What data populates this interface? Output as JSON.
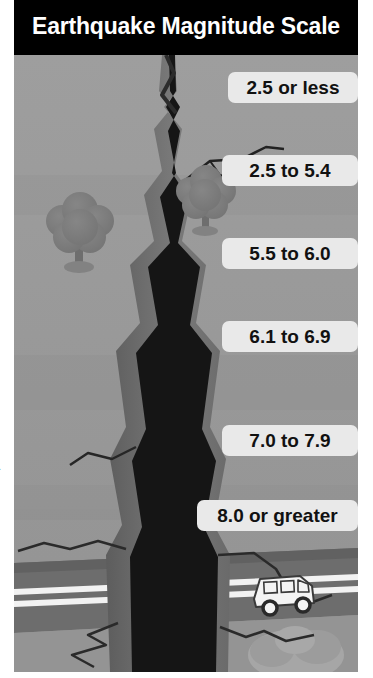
{
  "poster": {
    "title": "Earthquake Magnitude Scale",
    "margin_fragment": "n.",
    "colors": {
      "title_bar_background": "#000000",
      "title_text": "#ffffff",
      "ground": "#9b9b9b",
      "ground_shade": "#8e8e8e",
      "crack_interior": "#141414",
      "crack_wall": "#6f6f6f",
      "crack_wall_dark": "#4a4a4a",
      "road": "#6a6a6a",
      "road_line": "#f2f2f2",
      "tree": "#7c7c7c",
      "tree_trunk": "#6a6a6a",
      "van_body": "#f4f4f4",
      "van_detail": "#3a3a3a",
      "label_background": "#e9e9e9",
      "label_text": "#111111"
    }
  },
  "magnitude_scale": {
    "labels": [
      {
        "text": "2.5 or less"
      },
      {
        "text": "2.5 to 5.4"
      },
      {
        "text": "5.5 to 6.0"
      },
      {
        "text": "6.1 to 6.9"
      },
      {
        "text": "7.0 to 7.9"
      },
      {
        "text": "8.0 or greater"
      }
    ]
  },
  "illustration": {
    "elements": [
      {
        "name": "ground-plane"
      },
      {
        "name": "ground-fissure"
      },
      {
        "name": "tree-left"
      },
      {
        "name": "tree-right"
      },
      {
        "name": "road"
      },
      {
        "name": "road-center-line"
      },
      {
        "name": "van"
      },
      {
        "name": "rubble-pile"
      },
      {
        "name": "hairline-crack-upper-right"
      },
      {
        "name": "hairline-crack-lower-left"
      },
      {
        "name": "hairline-crack-lower-right"
      }
    ]
  }
}
